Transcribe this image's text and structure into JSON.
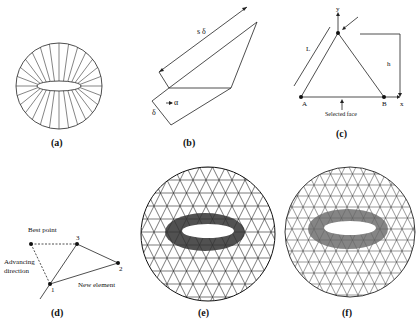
{
  "figure": {
    "panels": [
      {
        "id": "a",
        "caption": "(a)",
        "description": "Circular domain with airfoil and radial wedge lines"
      },
      {
        "id": "b",
        "caption": "(b)",
        "description": "Advancing layer with offset delta and angle alpha",
        "labels": {
          "s_delta": "s δ",
          "alpha": "α",
          "delta": "δ"
        }
      },
      {
        "id": "c",
        "caption": "(c)",
        "description": "Triangle with base AB, height h, side L",
        "labels": {
          "y": "y",
          "x": "x",
          "A": "A",
          "B": "B",
          "L": "L",
          "h": "h",
          "selected_face": "Selected face"
        }
      },
      {
        "id": "d",
        "caption": "(d)",
        "description": "Advancing front new element",
        "labels": {
          "best_point": "Best point",
          "n3": "3",
          "n2": "2",
          "n1": "1",
          "advancing_line1": "Advancing",
          "advancing_line2": "direction",
          "new_element": "New element"
        }
      },
      {
        "id": "e",
        "caption": "(e)",
        "description": "Triangular mesh around airfoil, coarse"
      },
      {
        "id": "f",
        "caption": "(f)",
        "description": "Triangular mesh around airfoil, refined"
      }
    ]
  }
}
